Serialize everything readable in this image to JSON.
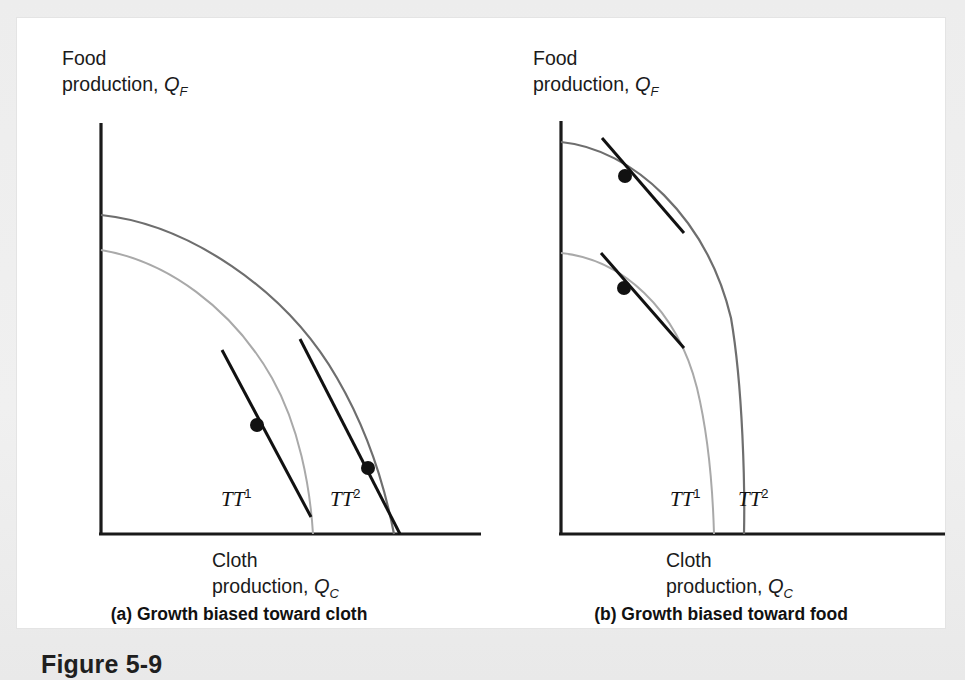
{
  "figure": {
    "number_label": "Figure 5-9",
    "page_background": "#ededed",
    "panel_background": "#ffffff"
  },
  "colors": {
    "axis": "#1a1a1a",
    "tangent": "#111111",
    "dot": "#111111",
    "curve_tt1": "#a9a9a9",
    "curve_tt2": "#6e6e6e",
    "text": "#111111"
  },
  "charts": [
    {
      "id": "chart-a",
      "subcaption": "(a) Growth biased toward cloth",
      "y_axis_title_line1": "Food",
      "y_axis_title_line2": "production, ",
      "y_axis_variable": "Q",
      "y_axis_subscript": "F",
      "x_axis_title_line1": "Cloth",
      "x_axis_title_line2": "production, ",
      "x_axis_variable": "Q",
      "x_axis_subscript": "C",
      "curve_labels": [
        {
          "name": "TT",
          "exponent": "1",
          "x": 204,
          "y": 480
        },
        {
          "name": "TT",
          "exponent": "2",
          "x": 313,
          "y": 480
        }
      ],
      "geometry": {
        "origin": {
          "x": 84,
          "y": 516
        },
        "y_axis_top": 105,
        "x_axis_right": 464,
        "curves": [
          {
            "name": "TT1",
            "color_key": "curve_tt1",
            "width": 2.0,
            "path": "M 84 232 C 150 243 215 290 255 360 C 282 408 293 468 296 516"
          },
          {
            "name": "TT2",
            "color_key": "curve_tt2",
            "width": 2.2,
            "path": "M 84 197 C 170 206 268 270 320 360 C 355 420 370 480 377 516"
          }
        ],
        "tangents": [
          {
            "name": "tangent-tt1",
            "x1": 205,
            "y1": 332,
            "x2": 294,
            "y2": 499,
            "width": 3.0
          },
          {
            "name": "tangent-tt2",
            "x1": 283,
            "y1": 321,
            "x2": 383,
            "y2": 516,
            "width": 3.0
          }
        ],
        "points": [
          {
            "name": "production-point-1",
            "x": 240,
            "y": 407,
            "r": 7.0
          },
          {
            "name": "production-point-2",
            "x": 351,
            "y": 450,
            "r": 7.0
          }
        ]
      }
    },
    {
      "id": "chart-b",
      "subcaption": "(b) Growth biased toward food",
      "y_axis_title_line1": "Food",
      "y_axis_title_line2": "production, ",
      "y_axis_variable": "Q",
      "y_axis_subscript": "F",
      "x_axis_title_line1": "Cloth",
      "x_axis_title_line2": "production, ",
      "x_axis_variable": "Q",
      "x_axis_subscript": "C",
      "curve_labels": [
        {
          "name": "TT",
          "exponent": "1",
          "x": 189,
          "y": 480
        },
        {
          "name": "TT",
          "exponent": "2",
          "x": 257,
          "y": 480
        }
      ],
      "geometry": {
        "origin": {
          "x": 80,
          "y": 516
        },
        "y_axis_top": 103,
        "x_axis_right": 464,
        "curves": [
          {
            "name": "TT1",
            "color_key": "curve_tt1",
            "width": 2.0,
            "path": "M 80 235 C 140 241 196 290 216 370 C 228 420 232 480 233 516"
          },
          {
            "name": "TT2",
            "color_key": "curve_tt2",
            "width": 2.2,
            "path": "M 80 124 C 152 131 226 200 250 300 C 262 370 264 470 263 516"
          }
        ],
        "tangents": [
          {
            "name": "tangent-tt2",
            "x1": 121,
            "y1": 120,
            "x2": 203,
            "y2": 215,
            "width": 3.0
          },
          {
            "name": "tangent-tt1",
            "x1": 120,
            "y1": 235,
            "x2": 203,
            "y2": 330,
            "width": 3.0
          }
        ],
        "points": [
          {
            "name": "production-point-2",
            "x": 144,
            "y": 158,
            "r": 7.0
          },
          {
            "name": "production-point-1",
            "x": 143,
            "y": 270,
            "r": 7.0
          }
        ]
      }
    }
  ],
  "chart_data": {
    "type": "line",
    "xlabel": "Cloth production, Q_C",
    "ylabel": "Food production, Q_F",
    "grid": false,
    "legend": "none",
    "axis_ticks": [],
    "panels": [
      {
        "panel": "(a) Growth biased toward cloth",
        "description": "Outward shift of the production possibility frontier biased toward cloth; frontier expands much more in the cloth direction than the food direction. Two tangency points show equilibrium production at relative prices with steeper/flatter tangent lines.",
        "series": [
          {
            "name": "TT1",
            "label": "TT^1",
            "role": "original production possibility frontier",
            "color": "#a9a9a9",
            "food_intercept": 0.62,
            "cloth_intercept": 0.56,
            "points_xy": [
              [
                0.0,
                0.62
              ],
              [
                0.12,
                0.605
              ],
              [
                0.25,
                0.56
              ],
              [
                0.35,
                0.5
              ],
              [
                0.45,
                0.4
              ],
              [
                0.52,
                0.26
              ],
              [
                0.56,
                0.1
              ],
              [
                0.56,
                0.0
              ]
            ]
          },
          {
            "name": "TT2",
            "label": "TT^2",
            "role": "post-growth frontier, cloth-biased",
            "color": "#6e6e6e",
            "food_intercept": 0.71,
            "cloth_intercept": 0.77,
            "points_xy": [
              [
                0.0,
                0.71
              ],
              [
                0.16,
                0.695
              ],
              [
                0.33,
                0.645
              ],
              [
                0.5,
                0.545
              ],
              [
                0.62,
                0.43
              ],
              [
                0.71,
                0.28
              ],
              [
                0.76,
                0.11
              ],
              [
                0.77,
                0.0
              ]
            ]
          }
        ],
        "tangency_points": [
          {
            "label": "production point on TT1",
            "x": 0.39,
            "y": 0.265
          },
          {
            "label": "production point on TT2",
            "x": 0.67,
            "y": 0.16
          }
        ]
      },
      {
        "panel": "(b) Growth biased toward food",
        "description": "Outward shift of the production possibility frontier biased toward food; frontier expands much more in the food direction than the cloth direction. Two parallel tangent lines of equal slope touch each frontier, showing unchanged relative price.",
        "series": [
          {
            "name": "TT1",
            "label": "TT^1",
            "role": "original production possibility frontier",
            "color": "#a9a9a9",
            "food_intercept": 0.68,
            "cloth_intercept": 0.4,
            "points_xy": [
              [
                0.0,
                0.68
              ],
              [
                0.09,
                0.665
              ],
              [
                0.2,
                0.6
              ],
              [
                0.29,
                0.49
              ],
              [
                0.35,
                0.36
              ],
              [
                0.39,
                0.18
              ],
              [
                0.4,
                0.0
              ]
            ]
          },
          {
            "name": "TT2",
            "label": "TT^2",
            "role": "post-growth frontier, food-biased",
            "color": "#6e6e6e",
            "food_intercept": 0.95,
            "cloth_intercept": 0.47,
            "points_xy": [
              [
                0.0,
                0.95
              ],
              [
                0.11,
                0.935
              ],
              [
                0.24,
                0.87
              ],
              [
                0.35,
                0.73
              ],
              [
                0.42,
                0.55
              ],
              [
                0.46,
                0.28
              ],
              [
                0.47,
                0.0
              ]
            ]
          }
        ],
        "tangency_points": [
          {
            "label": "production point on TT2",
            "x": 0.165,
            "y": 0.865
          },
          {
            "label": "production point on TT1",
            "x": 0.163,
            "y": 0.635
          }
        ]
      }
    ]
  }
}
